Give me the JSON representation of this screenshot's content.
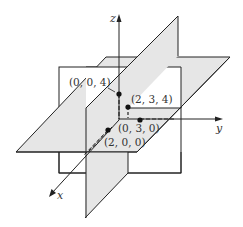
{
  "diagram": {
    "axes": {
      "x_label": "x",
      "y_label": "y",
      "z_label": "z"
    },
    "points": [
      {
        "label": "(0, 0, 4)",
        "coords": [
          0,
          0,
          4
        ]
      },
      {
        "label": "(2, 3, 4)",
        "coords": [
          2,
          3,
          4
        ]
      },
      {
        "label": "(0, 3, 0)",
        "coords": [
          0,
          3,
          0
        ]
      },
      {
        "label": "(2, 0, 0)",
        "coords": [
          2,
          0,
          0
        ]
      }
    ],
    "colors": {
      "plane_fill": "#e6e6e6",
      "back_plane_fill": "#ffffff",
      "line": "#222222"
    }
  }
}
